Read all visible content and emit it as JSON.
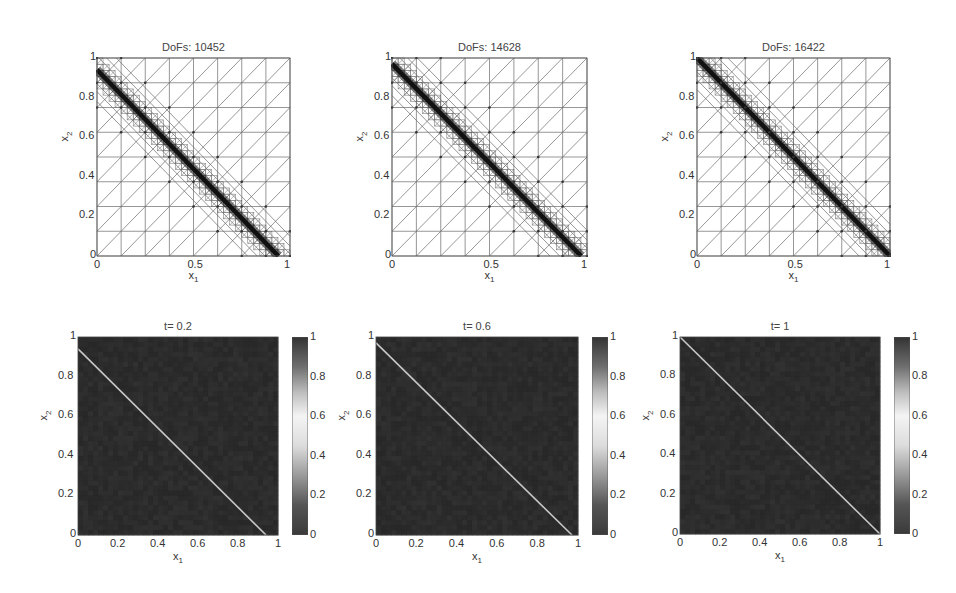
{
  "chart_data": [
    {
      "type": "mesh",
      "title": "DoFs: 10452",
      "xlabel": "x1",
      "ylabel": "x2",
      "xlim": [
        0,
        1
      ],
      "ylim": [
        0,
        1
      ],
      "xticks": [
        "0",
        "0.5",
        "1"
      ],
      "yticks": [
        "0",
        "0.2",
        "0.4",
        "0.6",
        "0.8",
        "1"
      ],
      "refinement_line": {
        "x_intercept": 0.94,
        "y_intercept": 0.94
      },
      "base_grid_divisions": 8
    },
    {
      "type": "mesh",
      "title": "DoFs: 14628",
      "xlabel": "x1",
      "ylabel": "x2",
      "xlim": [
        0,
        1
      ],
      "ylim": [
        0,
        1
      ],
      "xticks": [
        "0",
        "0.5",
        "1"
      ],
      "yticks": [
        "0",
        "0.2",
        "0.4",
        "0.6",
        "0.8",
        "1"
      ],
      "refinement_line": {
        "x_intercept": 0.97,
        "y_intercept": 0.97
      },
      "base_grid_divisions": 8
    },
    {
      "type": "mesh",
      "title": "DoFs: 16422",
      "xlabel": "x1",
      "ylabel": "x2",
      "xlim": [
        0,
        1
      ],
      "ylim": [
        0,
        1
      ],
      "xticks": [
        "0",
        "0.5",
        "1"
      ],
      "yticks": [
        "0",
        "0.2",
        "0.4",
        "0.6",
        "0.8",
        "1"
      ],
      "refinement_line": {
        "x_intercept": 1.0,
        "y_intercept": 1.0
      },
      "base_grid_divisions": 8
    },
    {
      "type": "heatmap",
      "title": "t= 0.2",
      "xlabel": "x1",
      "ylabel": "x2",
      "xlim": [
        0,
        1
      ],
      "ylim": [
        0,
        1
      ],
      "xticks": [
        "0",
        "0.2",
        "0.4",
        "0.6",
        "0.8",
        "1"
      ],
      "yticks": [
        "0",
        "0.2",
        "0.4",
        "0.6",
        "0.8",
        "1"
      ],
      "colorbar_ticks": [
        "0",
        "0.2",
        "0.4",
        "0.6",
        "0.8",
        "1"
      ],
      "colorbar_range": [
        0,
        1
      ],
      "front_line": {
        "x_intercept": 0.94,
        "y_intercept": 0.94
      }
    },
    {
      "type": "heatmap",
      "title": "t= 0.6",
      "xlabel": "x1",
      "ylabel": "x2",
      "xlim": [
        0,
        1
      ],
      "ylim": [
        0,
        1
      ],
      "xticks": [
        "0",
        "0.2",
        "0.4",
        "0.6",
        "0.8",
        "1"
      ],
      "yticks": [
        "0",
        "0.2",
        "0.4",
        "0.6",
        "0.8",
        "1"
      ],
      "colorbar_ticks": [
        "0",
        "0.2",
        "0.4",
        "0.6",
        "0.8",
        "1"
      ],
      "colorbar_range": [
        0,
        1
      ],
      "front_line": {
        "x_intercept": 0.97,
        "y_intercept": 0.97
      }
    },
    {
      "type": "heatmap",
      "title": "t= 1",
      "xlabel": "x1",
      "ylabel": "x2",
      "xlim": [
        0,
        1
      ],
      "ylim": [
        0,
        1
      ],
      "xticks": [
        "0",
        "0.2",
        "0.4",
        "0.6",
        "0.8",
        "1"
      ],
      "yticks": [
        "0",
        "0.2",
        "0.4",
        "0.6",
        "0.8",
        "1"
      ],
      "colorbar_ticks": [
        "0",
        "0.2",
        "0.4",
        "0.6",
        "0.8",
        "1"
      ],
      "colorbar_range": [
        0,
        1
      ],
      "front_line": {
        "x_intercept": 1.0,
        "y_intercept": 1.0
      }
    }
  ],
  "labels": {
    "x_main": "x",
    "x_sub": "1",
    "y_main": "x",
    "y_sub": "2"
  },
  "colors": {
    "mesh_line": "#6a6a6a",
    "mesh_dense": "#111111",
    "heatmap_bg": "#2e2e2e",
    "front": "#c8c8c8"
  }
}
